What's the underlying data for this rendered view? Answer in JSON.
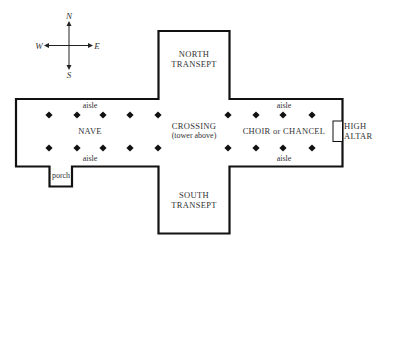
{
  "diagram": {
    "type": "cathedral-floor-plan",
    "colors": {
      "wall": "#111111",
      "text": "#333333",
      "background": "#ffffff"
    },
    "compass": {
      "north": "N",
      "south": "S",
      "east": "E",
      "west": "W"
    },
    "labels": {
      "north_transept_1": "NORTH",
      "north_transept_2": "TRANSEPT",
      "south_transept_1": "SOUTH",
      "south_transept_2": "TRANSEPT",
      "crossing_1": "CROSSING",
      "crossing_2": "(tower above)",
      "nave": "NAVE",
      "choir": "CHOIR or CHANCEL",
      "high_altar_1": "HIGH",
      "high_altar_2": "ALTAR",
      "aisle_nave_north": "aisle",
      "aisle_nave_south": "aisle",
      "aisle_choir_north": "aisle",
      "aisle_choir_south": "aisle",
      "porch": "porch"
    },
    "pillars": {
      "rows_y": [
        115,
        148
      ],
      "columns_x": [
        49,
        77,
        103,
        130,
        158,
        228,
        256,
        283,
        312
      ]
    }
  }
}
